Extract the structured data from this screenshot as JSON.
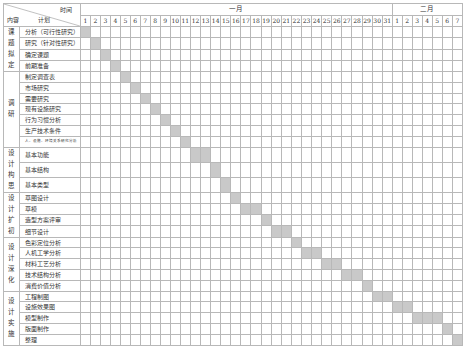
{
  "header": {
    "time_label": "时间",
    "content_label": "内容",
    "plan_label": "计划",
    "months": [
      {
        "label": "一月",
        "days": 31
      },
      {
        "label": "二月",
        "days": 7
      }
    ]
  },
  "colors": {
    "bar": "#c9c9c9",
    "grid": "#b8b8b8",
    "border": "#888888"
  },
  "chart_data": {
    "type": "gantt",
    "title": "",
    "xlabel": "时间",
    "ylabel": "内容 / 计划",
    "x_ticks": [
      "1",
      "2",
      "3",
      "4",
      "5",
      "6",
      "7",
      "8",
      "9",
      "10",
      "11",
      "12",
      "13",
      "14",
      "15",
      "16",
      "17",
      "18",
      "19",
      "20",
      "21",
      "22",
      "23",
      "24",
      "25",
      "26",
      "27",
      "28",
      "29",
      "30",
      "31",
      "1",
      "2",
      "3",
      "4",
      "5",
      "6",
      "7"
    ],
    "x_month_groups": [
      {
        "label": "一月",
        "start_col": 1,
        "end_col": 31
      },
      {
        "label": "二月",
        "start_col": 32,
        "end_col": 38
      }
    ],
    "phases": [
      {
        "label": "课题拟定",
        "tasks": [
          {
            "label": "分析（可行性研究）",
            "start": 1,
            "end": 1
          },
          {
            "label": "研究（针对性研究）",
            "start": 2,
            "end": 2
          },
          {
            "label": "确定课题",
            "start": 3,
            "end": 3
          },
          {
            "label": "前期准备",
            "start": 4,
            "end": 4
          }
        ]
      },
      {
        "label": "调研",
        "tasks": [
          {
            "label": "制定调查表",
            "start": 5,
            "end": 5
          },
          {
            "label": "市场研究",
            "start": 6,
            "end": 6
          },
          {
            "label": "需要研究",
            "start": 7,
            "end": 7
          },
          {
            "label": "现有设施研究",
            "start": 8,
            "end": 8
          },
          {
            "label": "行为习惯分析",
            "start": 9,
            "end": 9
          },
          {
            "label": "生产技术条件",
            "start": 10,
            "end": 10
          },
          {
            "label": "人、设施、环境关系研究分析",
            "start": 11,
            "end": 11,
            "small": true
          }
        ]
      },
      {
        "label": "设计构思",
        "tasks": [
          {
            "label": "基本功能",
            "start": 12,
            "end": 13
          },
          {
            "label": "基本结构",
            "start": 14,
            "end": 14
          },
          {
            "label": "基本类型",
            "start": 15,
            "end": 15
          }
        ]
      },
      {
        "label": "设计扩初",
        "tasks": [
          {
            "label": "草图设计",
            "start": 16,
            "end": 16
          },
          {
            "label": "草模",
            "start": 17,
            "end": 18
          },
          {
            "label": "造型方案评审",
            "start": 19,
            "end": 19
          },
          {
            "label": "细节设计",
            "start": 20,
            "end": 21
          }
        ]
      },
      {
        "label": "设计深化",
        "tasks": [
          {
            "label": "色彩定位分析",
            "start": 22,
            "end": 22
          },
          {
            "label": "人机工学分析",
            "start": 23,
            "end": 24
          },
          {
            "label": "材料工艺分析",
            "start": 25,
            "end": 26
          },
          {
            "label": "技术结构分析",
            "start": 27,
            "end": 28
          },
          {
            "label": "消费价值分析",
            "start": 29,
            "end": 29
          }
        ]
      },
      {
        "label": "设计实施",
        "tasks": [
          {
            "label": "工程制图",
            "start": 30,
            "end": 31
          },
          {
            "label": "设施效果图",
            "start": 32,
            "end": 33
          },
          {
            "label": "模型制作",
            "start": 34,
            "end": 36
          },
          {
            "label": "版面制作",
            "start": 37,
            "end": 37
          },
          {
            "label": "整理",
            "start": 38,
            "end": 38
          }
        ]
      }
    ],
    "grid": true,
    "legend": null
  }
}
